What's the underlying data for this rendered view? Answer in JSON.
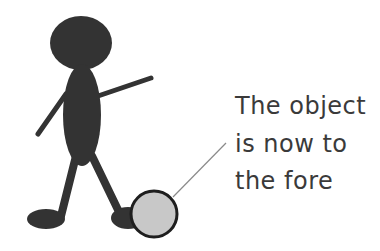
{
  "caption": {
    "lines": [
      "The object",
      "is now to",
      "the fore"
    ]
  },
  "colors": {
    "figure_fill": "#333333",
    "ball_fill": "#c8c8c8",
    "ball_stroke": "#1e1e1e",
    "callout_line": "#8a8a8a",
    "text": "#3a3a3a",
    "background": "#ffffff"
  },
  "figure": {
    "object": "ball"
  }
}
